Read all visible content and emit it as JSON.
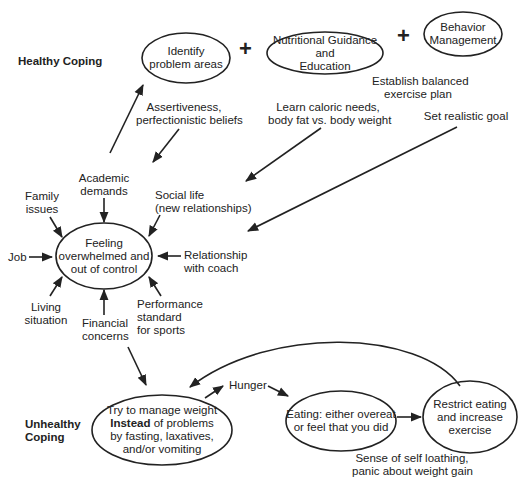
{
  "sections": {
    "healthy": "Healthy Coping",
    "unhealthy_line1": "Unhealthy",
    "unhealthy_line2": "Coping"
  },
  "healthy_nodes": {
    "identify": [
      "Identify",
      "problem areas"
    ],
    "nutrition": [
      "Nutritional Guidance",
      "and",
      "Education"
    ],
    "behavior": [
      "Behavior",
      "Management"
    ],
    "plus": "+"
  },
  "healthy_labels": {
    "assertiveness": [
      "Assertiveness,",
      "perfectionistic beliefs"
    ],
    "exercise_plan": [
      "Establish balanced",
      "exercise plan"
    ],
    "caloric": [
      "Learn caloric needs,",
      "body fat vs. body weight"
    ],
    "goal": "Set realistic goal"
  },
  "center_node": [
    "Feeling",
    "overwhelmed and",
    "out of control"
  ],
  "stressors": {
    "academic": [
      "Academic",
      "demands"
    ],
    "family": [
      "Family",
      "issues"
    ],
    "social": [
      "Social life",
      "(new relationships)"
    ],
    "job": "Job",
    "coach": [
      "Relationship",
      "with coach"
    ],
    "living": [
      "Living",
      "situation"
    ],
    "financial": [
      "Financial",
      "concerns"
    ],
    "performance": [
      "Performance",
      "standard",
      "for sports"
    ]
  },
  "unhealthy_nodes": {
    "manage": {
      "line1": "Try to manage weight",
      "line2_bold": "Instead",
      "line2_rest": " of problems",
      "line3": "by fasting, laxatives,",
      "line4": "and/or vomiting"
    },
    "eating": [
      "Eating: either overeat",
      "or feel that you did"
    ],
    "restrict": [
      "Restrict eating",
      "and increase",
      "exercise"
    ]
  },
  "unhealthy_labels": {
    "hunger": "Hunger",
    "loathing": [
      "Sense of self loathing,",
      "panic about weight gain"
    ]
  },
  "colors": {
    "ink": "#222222",
    "background": "#ffffff"
  }
}
